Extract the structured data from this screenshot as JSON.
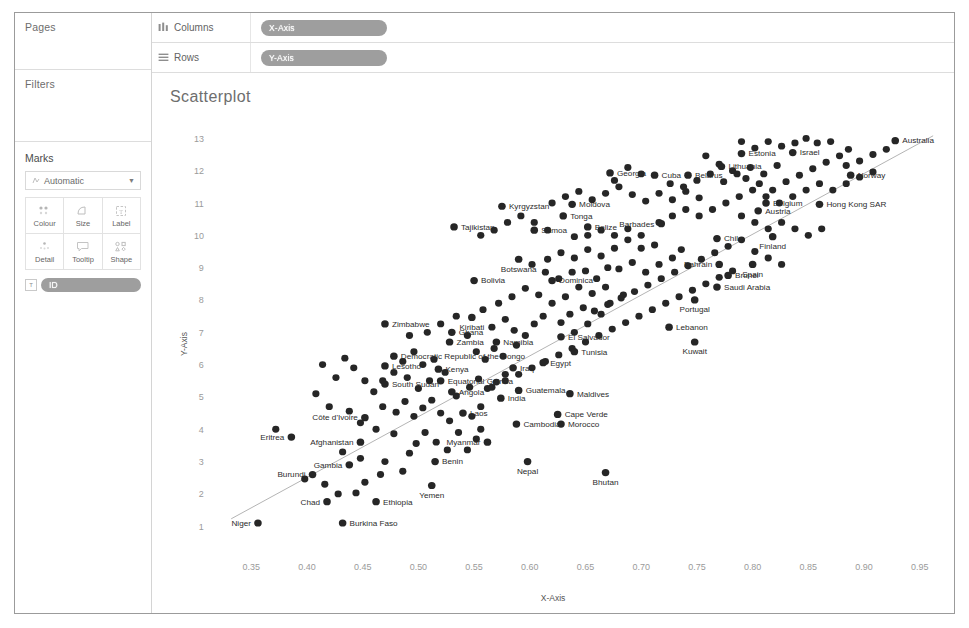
{
  "sidebar": {
    "pages": {
      "title": "Pages"
    },
    "filters": {
      "title": "Filters"
    },
    "marks": {
      "title": "Marks",
      "mark_type": "Automatic",
      "mark_type_icon": "automatic-marks-icon",
      "caret_icon": "chevron-down-icon",
      "properties": [
        {
          "label": "Colour",
          "icon": "colour-icon"
        },
        {
          "label": "Size",
          "icon": "size-icon"
        },
        {
          "label": "Label",
          "icon": "label-icon"
        },
        {
          "label": "Detail",
          "icon": "detail-icon"
        },
        {
          "label": "Tooltip",
          "icon": "tooltip-icon"
        },
        {
          "label": "Shape",
          "icon": "shape-icon"
        }
      ],
      "card_pill": {
        "label": "ID",
        "badge": "T"
      }
    }
  },
  "shelves": [
    {
      "name": "Columns",
      "icon": "columns-icon",
      "pill": "X-Axis"
    },
    {
      "name": "Rows",
      "icon": "rows-icon",
      "pill": "Y-Axis"
    }
  ],
  "chart_data": {
    "type": "scatter",
    "title": "Scatterplot",
    "xlabel": "X-Axis",
    "ylabel": "Y-Axis",
    "xlim": [
      0.32,
      0.97
    ],
    "ylim": [
      0.6,
      13.6
    ],
    "xticks": [
      0.35,
      0.4,
      0.45,
      0.5,
      0.55,
      0.6,
      0.65,
      0.7,
      0.75,
      0.8,
      0.85,
      0.9,
      0.95
    ],
    "yticks": [
      1,
      2,
      3,
      4,
      5,
      6,
      7,
      8,
      9,
      10,
      11,
      12,
      13
    ],
    "grid": false,
    "legend": "none",
    "trendline": {
      "x0": 0.332,
      "y0": 1.25,
      "x1": 0.962,
      "y1": 13.1
    },
    "points": [
      {
        "label": "Niger",
        "x": 0.356,
        "y": 1.12,
        "lp": "left"
      },
      {
        "label": "Burkina Faso",
        "x": 0.432,
        "y": 1.12,
        "lp": "right"
      },
      {
        "label": "Chad",
        "x": 0.418,
        "y": 1.78,
        "lp": "left"
      },
      {
        "label": "Ethiopia",
        "x": 0.462,
        "y": 1.78,
        "lp": "right"
      },
      {
        "label": "Yemen",
        "x": 0.512,
        "y": 2.28,
        "lp": "below"
      },
      {
        "label": "Burundi",
        "x": 0.405,
        "y": 2.62,
        "lp": "left"
      },
      {
        "label": "Gambia",
        "x": 0.438,
        "y": 2.92,
        "lp": "left"
      },
      {
        "label": "Benin",
        "x": 0.515,
        "y": 3.02,
        "lp": "right"
      },
      {
        "label": "Nepal",
        "x": 0.598,
        "y": 3.02,
        "lp": "below"
      },
      {
        "label": "Bhutan",
        "x": 0.668,
        "y": 2.68,
        "lp": "below"
      },
      {
        "label": "Afghanistan",
        "x": 0.448,
        "y": 3.62,
        "lp": "left"
      },
      {
        "label": "Eritrea",
        "x": 0.386,
        "y": 3.78,
        "lp": "left"
      },
      {
        "label": "Myanmar",
        "x": 0.562,
        "y": 3.62,
        "lp": "left"
      },
      {
        "label": "Cambodia",
        "x": 0.588,
        "y": 4.18,
        "lp": "right"
      },
      {
        "label": "Morocco",
        "x": 0.628,
        "y": 4.18,
        "lp": "right"
      },
      {
        "label": "Côte d'Ivoire",
        "x": 0.452,
        "y": 4.38,
        "lp": "left"
      },
      {
        "label": "Laos",
        "x": 0.54,
        "y": 4.52,
        "lp": "right"
      },
      {
        "label": "Cape Verde",
        "x": 0.625,
        "y": 4.48,
        "lp": "right"
      },
      {
        "label": "India",
        "x": 0.574,
        "y": 4.98,
        "lp": "right"
      },
      {
        "label": "Angola",
        "x": 0.53,
        "y": 5.18,
        "lp": "right"
      },
      {
        "label": "Guatemala",
        "x": 0.59,
        "y": 5.22,
        "lp": "right"
      },
      {
        "label": "Maldives",
        "x": 0.636,
        "y": 5.12,
        "lp": "right"
      },
      {
        "label": "South Sudan",
        "x": 0.47,
        "y": 5.42,
        "lp": "right"
      },
      {
        "label": "Equatorial Guinea",
        "x": 0.52,
        "y": 5.52,
        "lp": "right"
      },
      {
        "label": "Lesotho",
        "x": 0.47,
        "y": 5.98,
        "lp": "right"
      },
      {
        "label": "Kenya",
        "x": 0.518,
        "y": 5.88,
        "lp": "right"
      },
      {
        "label": "Iraq",
        "x": 0.585,
        "y": 5.92,
        "lp": "right"
      },
      {
        "label": "Egypt",
        "x": 0.612,
        "y": 6.08,
        "lp": "right"
      },
      {
        "label": "Democratic Republic of the Congo",
        "x": 0.478,
        "y": 6.28,
        "lp": "right"
      },
      {
        "label": "Tunisia",
        "x": 0.64,
        "y": 6.42,
        "lp": "right"
      },
      {
        "label": "Zambia",
        "x": 0.528,
        "y": 6.72,
        "lp": "right"
      },
      {
        "label": "Namibia",
        "x": 0.57,
        "y": 6.72,
        "lp": "right"
      },
      {
        "label": "El Salvador",
        "x": 0.628,
        "y": 6.88,
        "lp": "right"
      },
      {
        "label": "Ghana",
        "x": 0.53,
        "y": 7.02,
        "lp": "right"
      },
      {
        "label": "Zimbabwe",
        "x": 0.47,
        "y": 7.28,
        "lp": "right"
      },
      {
        "label": "Kiribati",
        "x": 0.548,
        "y": 7.48,
        "lp": "below"
      },
      {
        "label": "Lebanon",
        "x": 0.725,
        "y": 7.18,
        "lp": "right"
      },
      {
        "label": "Kuwait",
        "x": 0.748,
        "y": 6.72,
        "lp": "below"
      },
      {
        "label": "Portugal",
        "x": 0.748,
        "y": 8.02,
        "lp": "below"
      },
      {
        "label": "Saudi Arabia",
        "x": 0.768,
        "y": 8.42,
        "lp": "right"
      },
      {
        "label": "Brunei",
        "x": 0.778,
        "y": 8.78,
        "lp": "right"
      },
      {
        "label": "Spain",
        "x": 0.8,
        "y": 9.12,
        "lp": "below"
      },
      {
        "label": "Bahrain",
        "x": 0.77,
        "y": 9.12,
        "lp": "left"
      },
      {
        "label": "Bolivia",
        "x": 0.55,
        "y": 8.62,
        "lp": "right"
      },
      {
        "label": "Dominica",
        "x": 0.62,
        "y": 8.62,
        "lp": "right"
      },
      {
        "label": "Botswana",
        "x": 0.59,
        "y": 9.28,
        "lp": "below"
      },
      {
        "label": "Chile",
        "x": 0.768,
        "y": 9.92,
        "lp": "right"
      },
      {
        "label": "Finland",
        "x": 0.818,
        "y": 9.98,
        "lp": "below"
      },
      {
        "label": "Samoa",
        "x": 0.604,
        "y": 10.18,
        "lp": "right"
      },
      {
        "label": "Belize",
        "x": 0.652,
        "y": 10.28,
        "lp": "right"
      },
      {
        "label": "Barbades",
        "x": 0.718,
        "y": 10.38,
        "lp": "left"
      },
      {
        "label": "Tajikistan",
        "x": 0.532,
        "y": 10.28,
        "lp": "right"
      },
      {
        "label": "Tonga",
        "x": 0.63,
        "y": 10.62,
        "lp": "right"
      },
      {
        "label": "Kyrgyzstan",
        "x": 0.575,
        "y": 10.92,
        "lp": "right"
      },
      {
        "label": "Moldova",
        "x": 0.638,
        "y": 10.98,
        "lp": "right"
      },
      {
        "label": "Austria",
        "x": 0.805,
        "y": 10.78,
        "lp": "right"
      },
      {
        "label": "Belgium",
        "x": 0.812,
        "y": 11.02,
        "lp": "right"
      },
      {
        "label": "Hong Kong SAR",
        "x": 0.86,
        "y": 10.98,
        "lp": "right"
      },
      {
        "label": "Cuba",
        "x": 0.712,
        "y": 11.88,
        "lp": "right"
      },
      {
        "label": "Belarus",
        "x": 0.742,
        "y": 11.88,
        "lp": "right"
      },
      {
        "label": "Georgia",
        "x": 0.672,
        "y": 11.95,
        "lp": "right"
      },
      {
        "label": "Lithuania",
        "x": 0.772,
        "y": 12.15,
        "lp": "right"
      },
      {
        "label": "Norway",
        "x": 0.888,
        "y": 11.88,
        "lp": "right"
      },
      {
        "label": "Estonia",
        "x": 0.79,
        "y": 12.55,
        "lp": "right"
      },
      {
        "label": "Israel",
        "x": 0.836,
        "y": 12.58,
        "lp": "right"
      },
      {
        "label": "Australia",
        "x": 0.928,
        "y": 12.95,
        "lp": "right"
      }
    ],
    "unlabeled_points": [
      [
        0.372,
        4.02
      ],
      [
        0.398,
        2.48
      ],
      [
        0.416,
        2.32
      ],
      [
        0.428,
        2.02
      ],
      [
        0.444,
        2.05
      ],
      [
        0.452,
        2.38
      ],
      [
        0.466,
        2.62
      ],
      [
        0.47,
        3.02
      ],
      [
        0.448,
        3.12
      ],
      [
        0.432,
        3.32
      ],
      [
        0.486,
        2.72
      ],
      [
        0.492,
        3.28
      ],
      [
        0.498,
        3.58
      ],
      [
        0.478,
        3.88
      ],
      [
        0.462,
        4.02
      ],
      [
        0.448,
        4.22
      ],
      [
        0.438,
        4.58
      ],
      [
        0.42,
        4.72
      ],
      [
        0.408,
        5.12
      ],
      [
        0.468,
        4.72
      ],
      [
        0.48,
        4.55
      ],
      [
        0.488,
        4.88
      ],
      [
        0.496,
        4.42
      ],
      [
        0.504,
        4.68
      ],
      [
        0.512,
        4.92
      ],
      [
        0.52,
        4.52
      ],
      [
        0.528,
        4.28
      ],
      [
        0.536,
        3.92
      ],
      [
        0.506,
        3.92
      ],
      [
        0.516,
        3.62
      ],
      [
        0.526,
        3.38
      ],
      [
        0.544,
        3.38
      ],
      [
        0.552,
        3.72
      ],
      [
        0.556,
        4.02
      ],
      [
        0.548,
        4.42
      ],
      [
        0.556,
        4.72
      ],
      [
        0.534,
        5.05
      ],
      [
        0.546,
        5.32
      ],
      [
        0.554,
        5.58
      ],
      [
        0.562,
        5.28
      ],
      [
        0.57,
        5.48
      ],
      [
        0.578,
        5.72
      ],
      [
        0.524,
        5.78
      ],
      [
        0.51,
        5.52
      ],
      [
        0.5,
        5.28
      ],
      [
        0.49,
        5.62
      ],
      [
        0.504,
        6.02
      ],
      [
        0.514,
        6.18
      ],
      [
        0.496,
        6.42
      ],
      [
        0.486,
        6.12
      ],
      [
        0.478,
        5.78
      ],
      [
        0.468,
        5.52
      ],
      [
        0.46,
        5.18
      ],
      [
        0.452,
        5.52
      ],
      [
        0.442,
        5.92
      ],
      [
        0.434,
        6.22
      ],
      [
        0.426,
        5.62
      ],
      [
        0.414,
        6.02
      ],
      [
        0.492,
        6.92
      ],
      [
        0.508,
        7.02
      ],
      [
        0.52,
        7.28
      ],
      [
        0.534,
        7.52
      ],
      [
        0.544,
        6.92
      ],
      [
        0.552,
        6.42
      ],
      [
        0.56,
        6.18
      ],
      [
        0.568,
        6.52
      ],
      [
        0.576,
        6.28
      ],
      [
        0.588,
        6.62
      ],
      [
        0.596,
        6.92
      ],
      [
        0.604,
        7.28
      ],
      [
        0.612,
        7.52
      ],
      [
        0.586,
        7.08
      ],
      [
        0.578,
        7.42
      ],
      [
        0.566,
        7.18
      ],
      [
        0.558,
        7.72
      ],
      [
        0.572,
        7.92
      ],
      [
        0.584,
        8.12
      ],
      [
        0.596,
        8.38
      ],
      [
        0.608,
        8.18
      ],
      [
        0.62,
        7.92
      ],
      [
        0.632,
        8.12
      ],
      [
        0.644,
        8.42
      ],
      [
        0.656,
        8.22
      ],
      [
        0.648,
        7.78
      ],
      [
        0.636,
        7.58
      ],
      [
        0.628,
        7.32
      ],
      [
        0.64,
        7.02
      ],
      [
        0.652,
        7.28
      ],
      [
        0.664,
        7.58
      ],
      [
        0.672,
        7.92
      ],
      [
        0.684,
        8.18
      ],
      [
        0.668,
        8.42
      ],
      [
        0.66,
        8.68
      ],
      [
        0.65,
        8.92
      ],
      [
        0.638,
        8.88
      ],
      [
        0.626,
        8.68
      ],
      [
        0.614,
        8.88
      ],
      [
        0.602,
        9.12
      ],
      [
        0.616,
        9.28
      ],
      [
        0.628,
        9.48
      ],
      [
        0.64,
        9.32
      ],
      [
        0.652,
        9.58
      ],
      [
        0.664,
        9.38
      ],
      [
        0.676,
        9.62
      ],
      [
        0.688,
        9.88
      ],
      [
        0.7,
        9.62
      ],
      [
        0.692,
        9.18
      ],
      [
        0.68,
        8.98
      ],
      [
        0.67,
        9.02
      ],
      [
        0.704,
        8.88
      ],
      [
        0.716,
        9.12
      ],
      [
        0.728,
        9.32
      ],
      [
        0.736,
        9.58
      ],
      [
        0.712,
        9.72
      ],
      [
        0.7,
        10.02
      ],
      [
        0.688,
        10.22
      ],
      [
        0.676,
        10.02
      ],
      [
        0.664,
        10.18
      ],
      [
        0.652,
        10.02
      ],
      [
        0.64,
        9.98
      ],
      [
        0.616,
        10.18
      ],
      [
        0.604,
        10.42
      ],
      [
        0.592,
        10.62
      ],
      [
        0.58,
        10.42
      ],
      [
        0.568,
        10.18
      ],
      [
        0.556,
        10.02
      ],
      [
        0.62,
        11.02
      ],
      [
        0.632,
        11.22
      ],
      [
        0.644,
        11.38
      ],
      [
        0.656,
        11.12
      ],
      [
        0.668,
        11.32
      ],
      [
        0.68,
        11.52
      ],
      [
        0.692,
        11.28
      ],
      [
        0.704,
        11.08
      ],
      [
        0.716,
        11.32
      ],
      [
        0.728,
        11.12
      ],
      [
        0.74,
        11.38
      ],
      [
        0.752,
        11.18
      ],
      [
        0.688,
        12.12
      ],
      [
        0.7,
        11.92
      ],
      [
        0.676,
        11.72
      ],
      [
        0.726,
        11.62
      ],
      [
        0.738,
        11.52
      ],
      [
        0.75,
        11.72
      ],
      [
        0.762,
        11.92
      ],
      [
        0.774,
        11.68
      ],
      [
        0.786,
        11.92
      ],
      [
        0.798,
        12.12
      ],
      [
        0.81,
        11.92
      ],
      [
        0.822,
        12.18
      ],
      [
        0.758,
        12.48
      ],
      [
        0.77,
        12.22
      ],
      [
        0.782,
        12.02
      ],
      [
        0.794,
        11.78
      ],
      [
        0.806,
        11.62
      ],
      [
        0.818,
        11.42
      ],
      [
        0.83,
        11.68
      ],
      [
        0.842,
        11.88
      ],
      [
        0.854,
        12.08
      ],
      [
        0.866,
        12.28
      ],
      [
        0.878,
        12.48
      ],
      [
        0.886,
        12.68
      ],
      [
        0.858,
        12.88
      ],
      [
        0.87,
        12.92
      ],
      [
        0.848,
        13.02
      ],
      [
        0.838,
        12.88
      ],
      [
        0.826,
        12.78
      ],
      [
        0.814,
        12.92
      ],
      [
        0.802,
        12.72
      ],
      [
        0.79,
        12.92
      ],
      [
        0.884,
        12.18
      ],
      [
        0.896,
        12.32
      ],
      [
        0.908,
        12.52
      ],
      [
        0.92,
        12.68
      ],
      [
        0.908,
        11.98
      ],
      [
        0.896,
        11.82
      ],
      [
        0.884,
        11.62
      ],
      [
        0.872,
        11.42
      ],
      [
        0.86,
        11.62
      ],
      [
        0.848,
        11.42
      ],
      [
        0.836,
        11.22
      ],
      [
        0.824,
        11.02
      ],
      [
        0.812,
        11.22
      ],
      [
        0.8,
        11.42
      ],
      [
        0.788,
        11.22
      ],
      [
        0.776,
        11.02
      ],
      [
        0.764,
        10.82
      ],
      [
        0.752,
        10.62
      ],
      [
        0.74,
        10.82
      ],
      [
        0.728,
        10.62
      ],
      [
        0.716,
        10.42
      ],
      [
        0.79,
        10.62
      ],
      [
        0.802,
        10.42
      ],
      [
        0.814,
        10.22
      ],
      [
        0.826,
        10.42
      ],
      [
        0.838,
        10.22
      ],
      [
        0.85,
        10.02
      ],
      [
        0.862,
        10.22
      ],
      [
        0.79,
        9.88
      ],
      [
        0.778,
        9.68
      ],
      [
        0.766,
        9.48
      ],
      [
        0.754,
        9.28
      ],
      [
        0.742,
        9.08
      ],
      [
        0.73,
        8.88
      ],
      [
        0.718,
        8.68
      ],
      [
        0.706,
        8.48
      ],
      [
        0.694,
        8.28
      ],
      [
        0.682,
        8.08
      ],
      [
        0.67,
        7.88
      ],
      [
        0.658,
        7.68
      ],
      [
        0.802,
        9.52
      ],
      [
        0.814,
        9.32
      ],
      [
        0.826,
        9.12
      ],
      [
        0.782,
        8.92
      ],
      [
        0.77,
        8.72
      ],
      [
        0.758,
        8.52
      ],
      [
        0.746,
        8.32
      ],
      [
        0.734,
        8.12
      ],
      [
        0.722,
        7.92
      ],
      [
        0.71,
        7.72
      ],
      [
        0.698,
        7.52
      ],
      [
        0.686,
        7.32
      ],
      [
        0.674,
        7.12
      ],
      [
        0.662,
        6.92
      ],
      [
        0.65,
        6.72
      ],
      [
        0.638,
        6.52
      ],
      [
        0.626,
        6.32
      ],
      [
        0.614,
        6.12
      ],
      [
        0.602,
        5.92
      ],
      [
        0.59,
        5.72
      ],
      [
        0.578,
        5.52
      ],
      [
        0.566,
        5.32
      ]
    ]
  }
}
